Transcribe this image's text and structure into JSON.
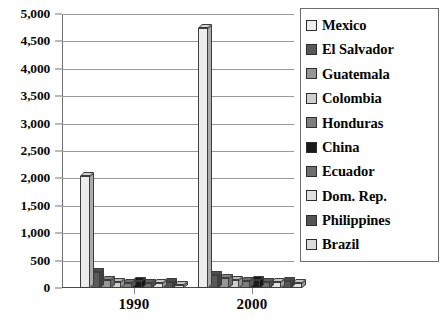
{
  "chart_data": {
    "type": "bar",
    "title": "",
    "subtitle": "",
    "xlabel": "",
    "ylabel": "",
    "categories": [
      "1990",
      "2000"
    ],
    "ylim": [
      0,
      5000
    ],
    "ytick_values": [
      0,
      500,
      1000,
      1500,
      2000,
      2500,
      3000,
      3500,
      4000,
      4500,
      5000
    ],
    "ytick_labels": [
      "0",
      "500",
      "1,000",
      "1,500",
      "2,000",
      "2,500",
      "3,000",
      "3,500",
      "4,000",
      "4,500",
      "5,000"
    ],
    "grid": true,
    "grid_axis": "y",
    "legend_position": "right",
    "style": "3d-grouped-bar-grayscale",
    "series": [
      {
        "name": "Mexico",
        "color": "#ededed",
        "values": [
          2050,
          4750
        ]
      },
      {
        "name": "El Salvador",
        "color": "#595959",
        "values": [
          300,
          230
        ]
      },
      {
        "name": "Guatemala",
        "color": "#969696",
        "values": [
          140,
          180
        ]
      },
      {
        "name": "Colombia",
        "color": "#cfcfcf",
        "values": [
          110,
          150
        ]
      },
      {
        "name": "Honduras",
        "color": "#7d7d7d",
        "values": [
          90,
          125
        ]
      },
      {
        "name": "China",
        "color": "#1b1b1b",
        "values": [
          130,
          145
        ]
      },
      {
        "name": "Ecuador",
        "color": "#6e6e6e",
        "values": [
          95,
          105
        ]
      },
      {
        "name": "Dom. Rep.",
        "color": "#e0e0e0",
        "values": [
          85,
          115
        ]
      },
      {
        "name": "Philippines",
        "color": "#545454",
        "values": [
          110,
          120
        ]
      },
      {
        "name": "Brazil",
        "color": "#dcdcdc",
        "values": [
          60,
          95
        ]
      }
    ]
  },
  "legend": {
    "items": [
      {
        "label": "Mexico"
      },
      {
        "label": "El Salvador"
      },
      {
        "label": "Guatemala"
      },
      {
        "label": "Colombia"
      },
      {
        "label": "Honduras"
      },
      {
        "label": "China"
      },
      {
        "label": "Ecuador"
      },
      {
        "label": "Dom. Rep."
      },
      {
        "label": "Philippines"
      },
      {
        "label": "Brazil"
      }
    ]
  },
  "caption": {
    "text": ""
  }
}
